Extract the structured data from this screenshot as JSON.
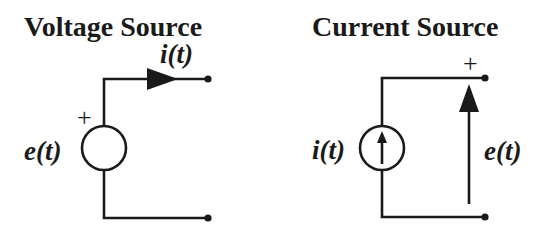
{
  "voltage_source": {
    "title": "Voltage Source",
    "current_label": "i(t)",
    "voltage_label": "e(t)",
    "polarity": "+"
  },
  "current_source": {
    "title": "Current Source",
    "current_label": "i(t)",
    "voltage_label": "e(t)",
    "polarity": "+"
  },
  "colors": {
    "ink": "#1a1a1a",
    "background": "#ffffff"
  }
}
